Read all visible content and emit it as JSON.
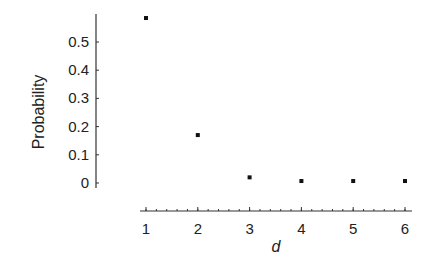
{
  "chart_data": {
    "type": "scatter",
    "title": "",
    "xlabel": "d",
    "ylabel": "Probability",
    "x": [
      1,
      2,
      3,
      4,
      5,
      6
    ],
    "values": [
      0.585,
      0.17,
      0.02,
      0.007,
      0.007,
      0.007
    ],
    "xlim": [
      1,
      6
    ],
    "ylim": [
      0,
      0.6
    ],
    "xticks": [
      "1",
      "2",
      "3",
      "4",
      "5",
      "6"
    ],
    "yticks": [
      "0",
      "0.1",
      "0.2",
      "0.3",
      "0.4",
      "0.5"
    ],
    "grid": false,
    "legend": null,
    "marker_color": "#111111",
    "axis_color": "#333333"
  }
}
